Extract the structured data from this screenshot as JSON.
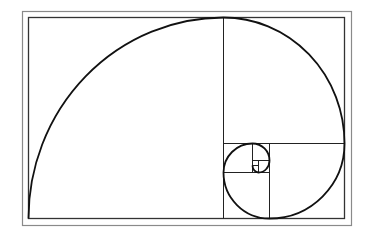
{
  "diagram": {
    "type": "golden-spiral",
    "colors": {
      "background": "#ffffff",
      "frame": "#8a8a8a",
      "grid": "#222222",
      "spiral": "#111111"
    },
    "outer_frame": {
      "x": 22,
      "y": 11,
      "w": 329,
      "h": 214
    },
    "inner_rect": {
      "x": 28,
      "y": 17,
      "w": 317,
      "h": 202
    }
  }
}
